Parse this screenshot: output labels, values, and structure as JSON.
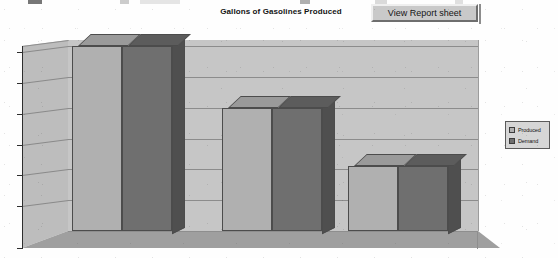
{
  "header": {
    "title": "Gallons of Gasolines Produced",
    "button_label": "View Report sheet"
  },
  "legend": {
    "items": [
      {
        "label": "Produced",
        "color": "#b0b0b0"
      },
      {
        "label": "Demand",
        "color": "#6f6f6f"
      }
    ]
  },
  "axis": {
    "y_ticks": [
      "3000",
      "2500",
      "2000",
      "1500",
      "1000",
      "500",
      "0"
    ],
    "x_ticks": [
      "Gas 1",
      "Gas 2",
      "Gas 3"
    ]
  },
  "chart_data": {
    "type": "bar",
    "title": "Gallons of Gasolines Produced",
    "xlabel": "",
    "ylabel": "",
    "ylim": [
      0,
      3000
    ],
    "yticks": [
      0,
      500,
      1000,
      1500,
      2000,
      2500,
      3000
    ],
    "grid": true,
    "legend_position": "right",
    "three_d": true,
    "categories": [
      "Gas 1",
      "Gas 2",
      "Gas 3"
    ],
    "series": [
      {
        "name": "Produced",
        "color": "#b0b0b0",
        "values": [
          3000,
          2000,
          1050
        ]
      },
      {
        "name": "Demand",
        "color": "#6f6f6f",
        "values": [
          3000,
          2000,
          1050
        ]
      }
    ]
  }
}
